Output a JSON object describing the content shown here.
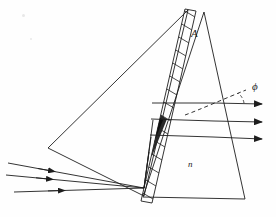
{
  "figure": {
    "domain": "diagram",
    "kind": "optical-ray-diagram",
    "background_color": "#fefefe",
    "stroke_color": "#1d1d1d",
    "canvas": {
      "width": 276,
      "height": 217
    }
  },
  "labels": {
    "apex_angle": "A",
    "refractive_index": "n",
    "diffraction_angle": "ϕ"
  },
  "annotations": [
    {
      "name": "apex-angle-label",
      "text": "A",
      "x": 196,
      "y": 34,
      "style": "italic-serif"
    },
    {
      "name": "refractive-index-label",
      "text": "n",
      "x": 192,
      "y": 164,
      "style": "italic-serif"
    },
    {
      "name": "diffraction-angle-label",
      "text": "ϕ",
      "x": 257,
      "y": 87,
      "style": "italic-serif"
    }
  ],
  "shapes": {
    "left_triangle": {
      "name": "collimator-triangle",
      "points": "188,10 48,148 144,196",
      "description": "Large left triangle with apex at top right"
    },
    "right_prism": {
      "name": "prism-triangle",
      "points": "204,12 143,197 245,199",
      "description": "Right prism carrying refractive index n and apex angle A"
    },
    "grating_band": {
      "name": "diffraction-grating-band",
      "outline": "185,9 196,11 152,203 141,201",
      "description": "Hatched narrow band representing the diffraction grating",
      "hatch_count": 15,
      "dark_segment_index": 8
    }
  },
  "rays": {
    "incoming": [
      {
        "name": "incident-ray-1",
        "path": "8,163 144,188",
        "arrow_at": 0.33
      },
      {
        "name": "incident-ray-2",
        "path": "6,175 144,188",
        "arrow_at": 0.33
      },
      {
        "name": "incident-ray-3",
        "path": "14,192 144,188",
        "arrow_at": 0.42
      }
    ],
    "internal": [
      {
        "name": "internal-ray-1",
        "path": "144,188 152,126"
      },
      {
        "name": "internal-ray-2",
        "path": "144,188 150,140"
      },
      {
        "name": "internal-ray-3",
        "path": "144,188 149,152"
      }
    ],
    "outgoing": [
      {
        "name": "diffracted-ray-0",
        "path": "152,103 215,103 264,104",
        "arrow": true
      },
      {
        "name": "diffracted-ray-1",
        "path": "151,119 215,121 264,122",
        "arrow": true
      },
      {
        "name": "diffracted-ray-2",
        "path": "150,135 213,137 264,139",
        "arrow": true
      }
    ],
    "reference_dashed": {
      "name": "reference-normal-dashed",
      "path": "186,114 214,104 244,92",
      "style": "dashed"
    },
    "angle_arc": {
      "name": "diffraction-angle-arc",
      "center": "246,103",
      "radius": 18
    }
  }
}
